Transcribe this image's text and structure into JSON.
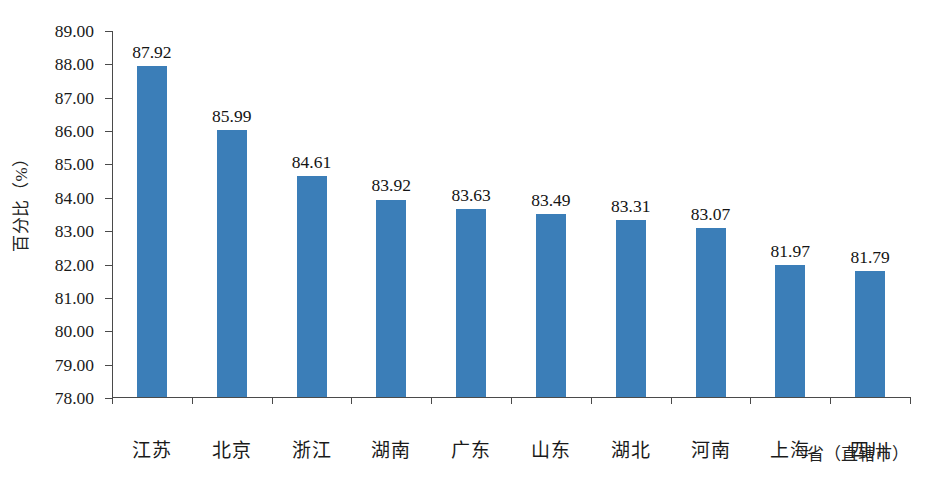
{
  "chart_data": {
    "type": "bar",
    "title": "",
    "xlabel": "省（直辖市）",
    "ylabel": "百分比（%）",
    "categories": [
      "江苏",
      "北京",
      "浙江",
      "湖南",
      "广东",
      "山东",
      "湖北",
      "河南",
      "上海",
      "四川"
    ],
    "values": [
      87.92,
      85.99,
      84.61,
      83.92,
      83.63,
      83.49,
      83.31,
      83.07,
      81.97,
      81.79
    ],
    "value_labels": [
      "87.92",
      "85.99",
      "84.61",
      "83.92",
      "83.63",
      "83.49",
      "83.31",
      "83.07",
      "81.97",
      "81.79"
    ],
    "ylim": [
      78.0,
      89.0
    ],
    "ytick_values": [
      89.0,
      88.0,
      87.0,
      86.0,
      85.0,
      84.0,
      83.0,
      82.0,
      81.0,
      80.0,
      79.0,
      78.0
    ],
    "ytick_labels": [
      "89.00",
      "88.00",
      "87.00",
      "86.00",
      "85.00",
      "84.00",
      "83.00",
      "82.00",
      "81.00",
      "80.00",
      "79.00",
      "78.00"
    ],
    "grid": false,
    "legend": false,
    "legend_position": "none",
    "bar_color": "#3b7eb8",
    "axis_color": "#4a4a4a",
    "background_color": "#ffffff"
  }
}
